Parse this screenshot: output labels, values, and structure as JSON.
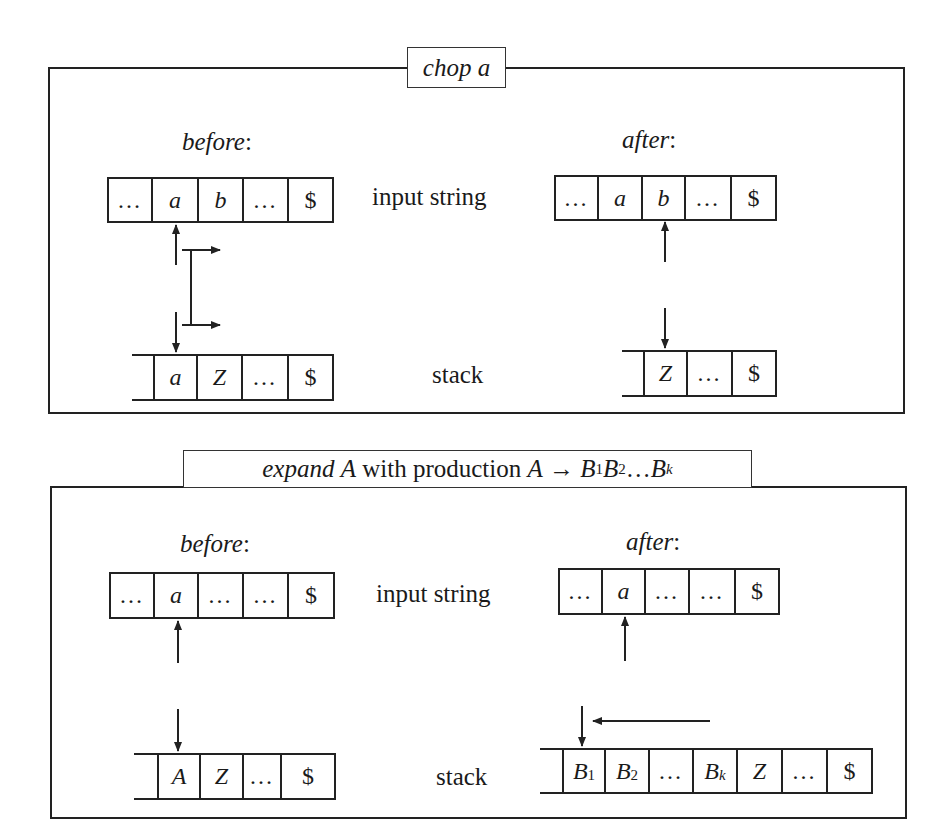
{
  "figure": {
    "panels": [
      {
        "id": "chop",
        "title_italic": "chop a",
        "title_rest": "",
        "before_label": "before",
        "after_label": "after",
        "colon": ":",
        "input_string_label": "input string",
        "stack_label": "stack",
        "before": {
          "input_cells": [
            "…",
            "a",
            "b",
            "…",
            "$"
          ],
          "input_pointer_index": 1,
          "stack_cells": [
            "a",
            "Z",
            "…",
            "$"
          ]
        },
        "after": {
          "input_cells": [
            "…",
            "a",
            "b",
            "…",
            "$"
          ],
          "input_pointer_index": 2,
          "stack_cells": [
            "Z",
            "…",
            "$"
          ]
        },
        "annotation": "bracket linking input pointer and stack top, both shifted right"
      },
      {
        "id": "expand",
        "title_italic": "expand",
        "title_rest": " A with production A → B",
        "title_full": "expand A with production A → B1B2 … Bk",
        "before_label": "before",
        "after_label": "after",
        "colon": ":",
        "input_string_label": "input string",
        "stack_label": "stack",
        "before": {
          "input_cells": [
            "…",
            "a",
            "…",
            "…",
            "$"
          ],
          "input_pointer_index": 1,
          "stack_cells": [
            "A",
            "Z",
            "…",
            "$"
          ]
        },
        "after": {
          "input_cells": [
            "…",
            "a",
            "…",
            "…",
            "$"
          ],
          "input_pointer_index": 1,
          "stack_cells": [
            {
              "base": "B",
              "sub": "1"
            },
            {
              "base": "B",
              "sub": "2"
            },
            {
              "base": "…",
              "sub": ""
            },
            {
              "base": "B",
              "sub": "k"
            },
            {
              "base": "Z",
              "sub": ""
            },
            {
              "base": "…",
              "sub": ""
            },
            {
              "base": "$",
              "sub": ""
            }
          ]
        },
        "annotation": "leftward arrow indicating right-hand side pushed onto stack"
      }
    ],
    "title2_parts": {
      "expand": "expand",
      "A1": "A",
      "with": " with production ",
      "A2": "A",
      "arrow": " → ",
      "B1": "B",
      "s1": "1",
      "B2": "B",
      "s2": "2",
      "dots": "…",
      "Bk": "B",
      "sk": "k"
    },
    "colors": {
      "ink": "#222222",
      "background": "#ffffff"
    }
  }
}
